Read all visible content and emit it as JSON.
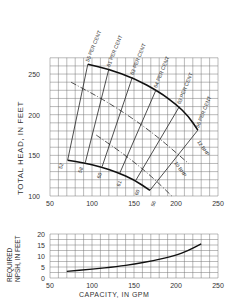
{
  "chart_data": [
    {
      "type": "line",
      "title": "",
      "xlabel": "",
      "ylabel": "TOTAL HEAD, IN FEET",
      "xlim": [
        50,
        250
      ],
      "ylim": [
        100,
        270
      ],
      "x_ticks": [
        50,
        100,
        150,
        200,
        250
      ],
      "y_ticks": [
        100,
        150,
        200,
        250
      ],
      "grid": true,
      "series": [
        {
          "name": "Head at max impeller",
          "x": [
            95,
            120,
            150,
            180,
            200,
            215,
            226
          ],
          "y": [
            262,
            256,
            245,
            228,
            213,
            198,
            181
          ]
        },
        {
          "name": "Head at min impeller",
          "x": [
            71,
            90,
            110,
            130,
            150,
            169
          ],
          "y": [
            144,
            141,
            136,
            129,
            120,
            107
          ]
        },
        {
          "name": "12 BHP",
          "x": [
            75,
            120,
            170,
            215
          ],
          "y": [
            240,
            215,
            180,
            140
          ]
        },
        {
          "name": "10 BHP",
          "x": [
            105,
            140,
            170,
            195
          ],
          "y": [
            175,
            150,
            125,
            100
          ]
        }
      ],
      "efficiency_lines": [
        {
          "label": "55 PER CENT",
          "low_label": "52",
          "top": [
            95,
            262
          ],
          "bottom": [
            71,
            144
          ]
        },
        {
          "label": "61 PER CENT",
          "low_label": "58",
          "top": [
            120,
            256
          ],
          "bottom": [
            92,
            141
          ]
        },
        {
          "label": "63 PER CENT",
          "low_label": "60",
          "top": [
            148,
            246
          ],
          "bottom": [
            112,
            136
          ]
        },
        {
          "label": "64 PER CENT",
          "low_label": "61",
          "top": [
            176,
            230
          ],
          "bottom": [
            133,
            128
          ]
        },
        {
          "label": "63 PER CENT",
          "low_label": "60",
          "top": [
            204,
            210
          ],
          "bottom": [
            152,
            119
          ]
        },
        {
          "label": "56 PER CENT",
          "low_label": "56",
          "top": [
            226,
            181
          ],
          "bottom": [
            169,
            107
          ]
        }
      ],
      "annotations": [
        "12 BHP",
        "10 BHP"
      ]
    },
    {
      "type": "line",
      "title": "",
      "xlabel": "CAPACITY, IN GPM",
      "ylabel": "REQUIRED NPSH, IN FEET",
      "xlim": [
        50,
        250
      ],
      "ylim": [
        0,
        20
      ],
      "x_ticks": [
        50,
        100,
        150,
        200,
        250
      ],
      "y_ticks": [
        0,
        5,
        10,
        15,
        20
      ],
      "grid": true,
      "series": [
        {
          "name": "Required NPSH",
          "x": [
            70,
            100,
            130,
            150,
            175,
            200,
            215,
            230
          ],
          "y": [
            3,
            4,
            5.2,
            6.3,
            8,
            10.3,
            12.5,
            15.5
          ]
        }
      ]
    }
  ],
  "labels": {
    "y_label_top": "TOTAL HEAD, IN FEET",
    "y_label_bottom_1": "REQUIRED",
    "y_label_bottom_2": "NPSH, IN FEET",
    "x_label": "CAPACITY, IN GPM",
    "bhp12": "12 BHP",
    "bhp10": "10 BHP"
  }
}
